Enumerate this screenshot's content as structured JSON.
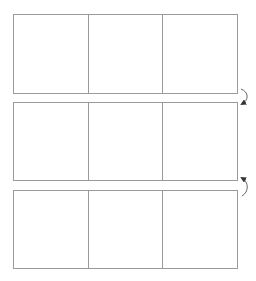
{
  "diagram": {
    "line_color": "#9a9a9a",
    "arrow_color": "#333333",
    "grids": [
      {
        "id": "grid-1",
        "columns": 3,
        "cells": [
          "",
          "",
          ""
        ]
      },
      {
        "id": "grid-2",
        "columns": 3,
        "cells": [
          "",
          "",
          ""
        ]
      },
      {
        "id": "grid-3",
        "columns": 3,
        "cells": [
          "",
          "",
          ""
        ]
      }
    ],
    "arrows": [
      {
        "from": "grid-1",
        "to": "grid-2",
        "direction": "down"
      },
      {
        "from": "grid-3",
        "to": "grid-2",
        "direction": "up"
      }
    ]
  }
}
